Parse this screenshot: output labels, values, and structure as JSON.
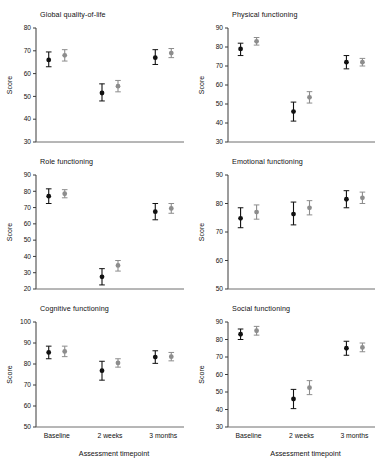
{
  "figure": {
    "xlabel": "Assessment timepoint",
    "ylabel": "Score",
    "timepoints": [
      "Baseline",
      "2 weeks",
      "3 months"
    ]
  },
  "chart_data": [
    {
      "type": "scatter",
      "title": "Global quality-of-life",
      "xlabel": "",
      "ylabel": "Score",
      "categories": [
        "Baseline",
        "2 weeks",
        "3 months"
      ],
      "ylim": [
        30,
        80
      ],
      "yticks": [
        30,
        40,
        50,
        60,
        70,
        80
      ],
      "grid": false,
      "legend": "none",
      "series": [
        {
          "name": "Group 1",
          "marker": "filled",
          "color": "#111111",
          "values": [
            66,
            51.5,
            67
          ],
          "err_low": [
            63,
            48,
            64
          ],
          "err_high": [
            69.5,
            55.5,
            70.5
          ]
        },
        {
          "name": "Group 2",
          "marker": "filled-gray",
          "color": "#8d8d8d",
          "values": [
            68,
            54.5,
            69
          ],
          "err_low": [
            65.5,
            52,
            67
          ],
          "err_high": [
            70.5,
            57,
            71
          ]
        }
      ]
    },
    {
      "type": "scatter",
      "title": "Physical functioning",
      "xlabel": "",
      "ylabel": "Score",
      "categories": [
        "Baseline",
        "2 weeks",
        "3 months"
      ],
      "ylim": [
        30,
        90
      ],
      "yticks": [
        30,
        40,
        50,
        60,
        70,
        80,
        90
      ],
      "grid": false,
      "legend": "none",
      "series": [
        {
          "name": "Group 1",
          "marker": "filled",
          "color": "#111111",
          "values": [
            79,
            46,
            72
          ],
          "err_low": [
            75.5,
            41,
            68.5
          ],
          "err_high": [
            82,
            51,
            75.5
          ]
        },
        {
          "name": "Group 2",
          "marker": "filled-gray",
          "color": "#8d8d8d",
          "values": [
            83,
            53.5,
            72
          ],
          "err_low": [
            81,
            50.5,
            70
          ],
          "err_high": [
            85,
            56.5,
            74
          ]
        }
      ]
    },
    {
      "type": "scatter",
      "title": "Role functioning",
      "xlabel": "",
      "ylabel": "Score",
      "categories": [
        "Baseline",
        "2 weeks",
        "3 months"
      ],
      "ylim": [
        20,
        90
      ],
      "yticks": [
        20,
        30,
        40,
        50,
        60,
        70,
        80,
        90
      ],
      "grid": false,
      "legend": "none",
      "series": [
        {
          "name": "Group 1",
          "marker": "filled",
          "color": "#111111",
          "values": [
            77,
            27.5,
            67.5
          ],
          "err_low": [
            72.5,
            22.5,
            62.5
          ],
          "err_high": [
            81.5,
            32.5,
            72.5
          ]
        },
        {
          "name": "Group 2",
          "marker": "filled-gray",
          "color": "#8d8d8d",
          "values": [
            78.5,
            34.5,
            69.5
          ],
          "err_low": [
            76,
            31,
            66.5
          ],
          "err_high": [
            81,
            37.5,
            72.5
          ]
        }
      ]
    },
    {
      "type": "scatter",
      "title": "Emotional functioning",
      "xlabel": "",
      "ylabel": "Score",
      "categories": [
        "Baseline",
        "2 weeks",
        "3 months"
      ],
      "ylim": [
        50,
        90
      ],
      "yticks": [
        50,
        60,
        70,
        80,
        90
      ],
      "grid": false,
      "legend": "none",
      "series": [
        {
          "name": "Group 1",
          "marker": "filled",
          "color": "#111111",
          "values": [
            74.8,
            76.3,
            81.5
          ],
          "err_low": [
            71.5,
            72.5,
            78.5
          ],
          "err_high": [
            78.5,
            80.5,
            84.5
          ]
        },
        {
          "name": "Group 2",
          "marker": "filled-gray",
          "color": "#8d8d8d",
          "values": [
            77,
            78.5,
            82
          ],
          "err_low": [
            74.5,
            76,
            80
          ],
          "err_high": [
            79.5,
            81,
            84
          ]
        }
      ]
    },
    {
      "type": "scatter",
      "title": "Cognitive functioning",
      "xlabel": "Assessment timepoint",
      "ylabel": "Score",
      "categories": [
        "Baseline",
        "2 weeks",
        "3 months"
      ],
      "ylim": [
        50,
        100
      ],
      "yticks": [
        50,
        60,
        70,
        80,
        90,
        100
      ],
      "grid": false,
      "legend": "none",
      "series": [
        {
          "name": "Group 1",
          "marker": "filled",
          "color": "#111111",
          "values": [
            85.5,
            76.8,
            83.3
          ],
          "err_low": [
            82.5,
            72.3,
            80.3
          ],
          "err_high": [
            88.5,
            81.3,
            86.3
          ]
        },
        {
          "name": "Group 2",
          "marker": "filled-gray",
          "color": "#8d8d8d",
          "values": [
            86,
            80.5,
            83.5
          ],
          "err_low": [
            83.5,
            78.5,
            81.5
          ],
          "err_high": [
            88.5,
            82.5,
            85.5
          ]
        }
      ]
    },
    {
      "type": "scatter",
      "title": "Social functioning",
      "xlabel": "Assessment timepoint",
      "ylabel": "Score",
      "categories": [
        "Baseline",
        "2 weeks",
        "3 months"
      ],
      "ylim": [
        30,
        90
      ],
      "yticks": [
        30,
        40,
        50,
        60,
        70,
        80,
        90
      ],
      "grid": false,
      "legend": "none",
      "series": [
        {
          "name": "Group 1",
          "marker": "filled",
          "color": "#111111",
          "values": [
            83,
            46,
            75
          ],
          "err_low": [
            80,
            40.5,
            71
          ],
          "err_high": [
            86,
            51.5,
            79
          ]
        },
        {
          "name": "Group 2",
          "marker": "filled-gray",
          "color": "#8d8d8d",
          "values": [
            85,
            52.5,
            75.5
          ],
          "err_low": [
            82.5,
            48.5,
            73
          ],
          "err_high": [
            87.5,
            56.5,
            78
          ]
        }
      ]
    }
  ]
}
